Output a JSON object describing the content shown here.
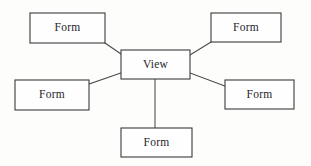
{
  "diagram": {
    "type": "node-link",
    "background_color": "#fdfdfc",
    "border_color": "#3b3b3b",
    "line_color": "#4a4a4a",
    "text_color": "#26262a",
    "center_node": {
      "id": "view",
      "label": "View",
      "x": 121,
      "y": 50,
      "width": 69,
      "height": 29
    },
    "nodes": [
      {
        "id": "form-top-left",
        "label": "Form",
        "x": 30,
        "y": 13,
        "width": 75,
        "height": 30,
        "position": "top-left"
      },
      {
        "id": "form-top-right",
        "label": "Form",
        "x": 211,
        "y": 13,
        "width": 70,
        "height": 29,
        "position": "top-right"
      },
      {
        "id": "form-left",
        "label": "Form",
        "x": 15,
        "y": 80,
        "width": 74,
        "height": 30,
        "position": "left"
      },
      {
        "id": "form-right",
        "label": "Form",
        "x": 225,
        "y": 80,
        "width": 69,
        "height": 29,
        "position": "right"
      },
      {
        "id": "form-bottom",
        "label": "Form",
        "x": 121,
        "y": 128,
        "width": 71,
        "height": 29,
        "position": "bottom"
      }
    ],
    "edges": [
      {
        "id": "edge-view-form-top-left",
        "from": "form-top-left",
        "to": "view",
        "x1": 105,
        "y1": 43,
        "x2": 121,
        "y2": 54
      },
      {
        "id": "edge-view-form-top-right",
        "from": "view",
        "to": "form-top-right",
        "x1": 190,
        "y1": 55,
        "x2": 211,
        "y2": 42
      },
      {
        "id": "edge-view-form-left",
        "from": "form-left",
        "to": "view",
        "x1": 89,
        "y1": 84,
        "x2": 121,
        "y2": 73
      },
      {
        "id": "edge-view-form-right",
        "from": "view",
        "to": "form-right",
        "x1": 190,
        "y1": 73,
        "x2": 225,
        "y2": 86
      },
      {
        "id": "edge-view-form-bottom",
        "from": "view",
        "to": "form-bottom",
        "x1": 155,
        "y1": 79,
        "x2": 155,
        "y2": 128
      }
    ]
  }
}
